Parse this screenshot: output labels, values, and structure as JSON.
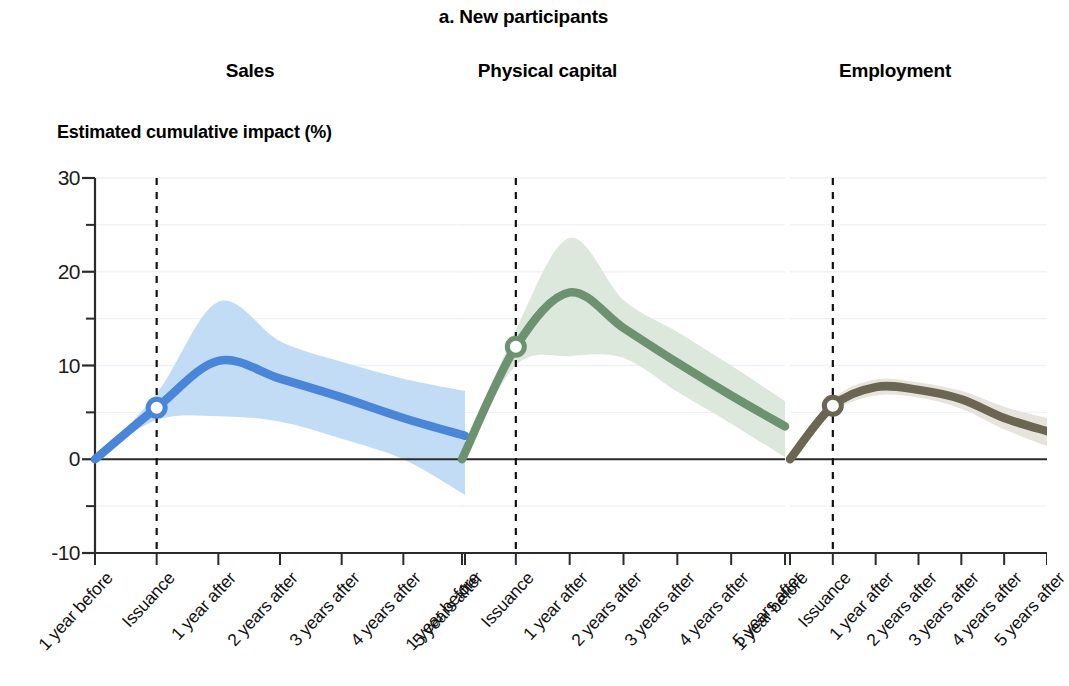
{
  "figure": {
    "title": "a. New participants",
    "y_axis_label": "Estimated cumulative impact (%)"
  },
  "panels": [
    {
      "name": "Sales",
      "title": "Sales"
    },
    {
      "name": "Physical capital",
      "title": "Physical capital"
    },
    {
      "name": "Employment",
      "title": "Employment"
    }
  ],
  "y_ticks": [
    "30",
    "20",
    "10",
    "0",
    "-10"
  ],
  "x_ticks": [
    "1 year before",
    "Issuance",
    "1 year after",
    "2 years after",
    "3 years after",
    "4 years after",
    "5 years after"
  ],
  "colors": {
    "sales_line": "#4a86d8",
    "sales_band": "#c3dcf5",
    "capital_line": "#6d9270",
    "capital_band": "#dde8dc",
    "employment_line": "#6b6652",
    "employment_band": "#e6e4dc",
    "axis": "#2b2b2b",
    "gridline": "#eef2f6",
    "event_line": "#111111",
    "marker_fill": "#ffffff"
  },
  "chart_data": {
    "type": "line",
    "title": "a. New participants",
    "xlabel": "",
    "ylabel": "Estimated cumulative impact (%)",
    "ylim": [
      -10,
      30
    ],
    "y_ticks_major": [
      -10,
      0,
      10,
      20,
      30
    ],
    "y_ticks_minor": [
      -5,
      5,
      15,
      25
    ],
    "grid": true,
    "legend_position": "none",
    "x": [
      -1,
      0,
      1,
      2,
      3,
      4,
      5
    ],
    "x_tick_labels": [
      "1 year before",
      "Issuance",
      "1 year after",
      "2 years after",
      "3 years after",
      "4 years after",
      "5 years after"
    ],
    "event_marker": {
      "at_x": 0,
      "style": "dashed vertical line",
      "label": "Issuance",
      "point_marker": "hollow circle on each series at Issuance"
    },
    "panels": [
      {
        "name": "Sales",
        "color": "#4a86d8",
        "band_color": "#c3dcf5",
        "series": [
          {
            "name": "Estimated cumulative impact",
            "values": [
              0.0,
              5.5,
              10.5,
              8.6,
              6.6,
              4.4,
              2.5
            ]
          },
          {
            "name": "Upper confidence bound",
            "values": [
              0.0,
              7.0,
              16.8,
              12.6,
              10.4,
              8.6,
              7.3
            ]
          },
          {
            "name": "Lower confidence bound",
            "values": [
              0.0,
              4.2,
              4.6,
              4.0,
              2.2,
              0.0,
              -3.8
            ]
          }
        ],
        "marker_value_at_issuance": 5.5,
        "peak_value": 10.7,
        "peak_x": 1.2
      },
      {
        "name": "Physical capital",
        "color": "#6d9270",
        "band_color": "#dde8dc",
        "series": [
          {
            "name": "Estimated cumulative impact",
            "values": [
              0.0,
              12.0,
              17.8,
              14.0,
              10.3,
              6.8,
              3.5
            ]
          },
          {
            "name": "Upper confidence bound",
            "values": [
              0.0,
              13.8,
              23.6,
              17.0,
              13.6,
              10.0,
              6.2
            ]
          },
          {
            "name": "Lower confidence bound",
            "values": [
              0.0,
              10.0,
              11.0,
              10.8,
              7.2,
              3.8,
              0.2
            ]
          }
        ],
        "marker_value_at_issuance": 12.0,
        "peak_value": 17.9,
        "peak_x": 1.1
      },
      {
        "name": "Employment",
        "color": "#6b6652",
        "band_color": "#e6e4dc",
        "series": [
          {
            "name": "Estimated cumulative impact",
            "values": [
              0.0,
              5.7,
              7.7,
              7.4,
              6.4,
              4.4,
              3.0
            ]
          },
          {
            "name": "Upper confidence bound",
            "values": [
              0.0,
              6.4,
              8.5,
              8.2,
              7.3,
              5.6,
              4.4
            ]
          },
          {
            "name": "Lower confidence bound",
            "values": [
              0.0,
              5.0,
              6.8,
              6.6,
              5.4,
              3.2,
              1.4
            ]
          }
        ],
        "marker_value_at_issuance": 5.7,
        "peak_value": 7.8,
        "peak_x": 1.4
      }
    ]
  }
}
